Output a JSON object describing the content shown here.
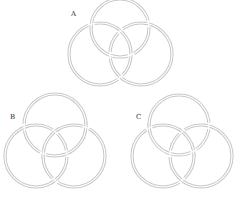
{
  "figures": [
    {
      "label": "A",
      "label_pos": [
        71,
        11
      ],
      "rings": [
        {
          "name": "top",
          "cx": 120,
          "cy": 28,
          "r": 29
        },
        {
          "name": "left",
          "cx": 100,
          "cy": 54,
          "r": 31
        },
        {
          "name": "right",
          "cx": 141,
          "cy": 54,
          "r": 31
        }
      ]
    },
    {
      "label": "B",
      "label_pos": [
        10,
        114
      ],
      "rings": [
        {
          "name": "top",
          "cx": 55,
          "cy": 125,
          "r": 31
        },
        {
          "name": "left",
          "cx": 36,
          "cy": 156,
          "r": 31
        },
        {
          "name": "right",
          "cx": 74,
          "cy": 156,
          "r": 31
        }
      ]
    },
    {
      "label": "C",
      "label_pos": [
        136,
        114
      ],
      "rings": [
        {
          "name": "top",
          "cx": 179,
          "cy": 125,
          "r": 30
        },
        {
          "name": "left",
          "cx": 163,
          "cy": 156,
          "r": 31
        },
        {
          "name": "right",
          "cx": 201,
          "cy": 156,
          "r": 31
        }
      ]
    }
  ],
  "colors": {
    "ring_stroke": "#c8c8c8",
    "background": "#ffffff",
    "label": "#333333"
  }
}
